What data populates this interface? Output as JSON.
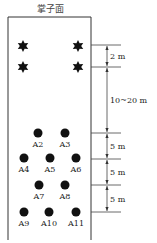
{
  "title": "掌子面",
  "stars": [
    {
      "id": "S1"
    },
    {
      "id": "S2"
    },
    {
      "id": "S3"
    },
    {
      "id": "S4"
    }
  ],
  "holes": [
    {
      "label": "A2"
    },
    {
      "label": "A3"
    },
    {
      "label": "A4"
    },
    {
      "label": "A5"
    },
    {
      "label": "A6"
    },
    {
      "label": "A7"
    },
    {
      "label": "A8"
    },
    {
      "label": "A9"
    },
    {
      "label": "A10"
    },
    {
      "label": "A11"
    }
  ],
  "dimensions": [
    {
      "label": "2 m"
    },
    {
      "label": "10~20 m"
    },
    {
      "label": "5 m"
    },
    {
      "label": "5 m"
    },
    {
      "label": "5 m"
    }
  ]
}
